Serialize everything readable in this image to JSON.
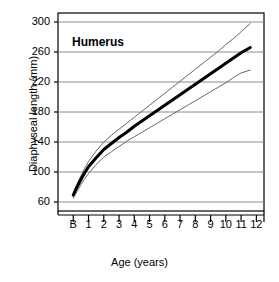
{
  "chart_data": {
    "type": "line",
    "title": "Humerus",
    "xlabel": "Age (years)",
    "ylabel": "Diaphyseal length (mm)",
    "xlim": [
      -1,
      12.5
    ],
    "ylim": [
      48,
      312
    ],
    "yticks": [
      60,
      100,
      140,
      180,
      220,
      260,
      300
    ],
    "xticks": [
      "B",
      "1",
      "2",
      "3",
      "4",
      "5",
      "6",
      "7",
      "8",
      "9",
      "10",
      "11",
      "12"
    ],
    "grid": true,
    "legend": "none",
    "axis_color": "#000000",
    "grid_color": "#808080",
    "series": [
      {
        "name": "upper percentile",
        "style": "thin",
        "color": "#666666",
        "x": [
          0,
          0.25,
          0.5,
          0.75,
          1,
          1.5,
          2,
          2.5,
          3,
          3.5,
          4,
          4.5,
          5,
          5.5,
          6,
          6.5,
          7,
          7.5,
          8,
          8.5,
          9,
          9.5,
          10,
          10.5,
          11,
          11.6
        ],
        "y": [
          72,
          84,
          95,
          105,
          114,
          128,
          140,
          149,
          157,
          165,
          173,
          181,
          189,
          197,
          205,
          213,
          221,
          229,
          237,
          245,
          253,
          261,
          270,
          278,
          287,
          298
        ]
      },
      {
        "name": "mean",
        "style": "thick",
        "color": "#000000",
        "x": [
          0,
          0.25,
          0.5,
          0.75,
          1,
          1.5,
          2,
          2.5,
          3,
          3.5,
          4,
          4.5,
          5,
          5.5,
          6,
          6.5,
          7,
          7.5,
          8,
          8.5,
          9,
          9.5,
          10,
          10.5,
          11,
          11.6
        ],
        "y": [
          69,
          80,
          90,
          99,
          107,
          119,
          130,
          138,
          146,
          153,
          161,
          168,
          175,
          182,
          189,
          196,
          203,
          210,
          217,
          224,
          231,
          238,
          245,
          252,
          259,
          266
        ]
      },
      {
        "name": "lower percentile",
        "style": "thin",
        "color": "#666666",
        "x": [
          0,
          0.25,
          0.5,
          0.75,
          1,
          1.5,
          2,
          2.5,
          3,
          3.5,
          4,
          4.5,
          5,
          5.5,
          6,
          6.5,
          7,
          7.5,
          8,
          8.5,
          9,
          9.5,
          10,
          10.5,
          11,
          11.6
        ],
        "y": [
          65,
          74,
          83,
          91,
          98,
          110,
          120,
          127,
          134,
          141,
          147,
          153,
          159,
          165,
          171,
          177,
          183,
          189,
          195,
          201,
          207,
          213,
          219,
          226,
          232,
          236
        ]
      }
    ]
  }
}
